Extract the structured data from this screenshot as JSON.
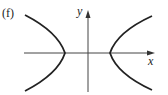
{
  "figure": {
    "panel_label": "(f)",
    "x_axis_label": "x",
    "y_axis_label": "y"
  },
  "colors": {
    "curve": "#222222",
    "axis": "#444444",
    "background": "#ffffff"
  }
}
